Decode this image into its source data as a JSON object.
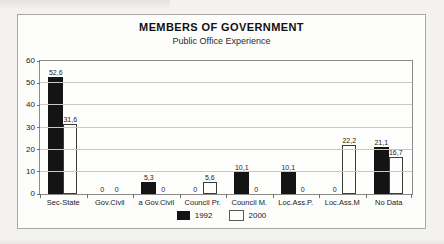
{
  "header": {
    "title": "MEMBERS OF GOVERNMENT",
    "subtitle": "Public Office Experience"
  },
  "chart_data": {
    "type": "bar",
    "title": "MEMBERS OF GOVERNMENT",
    "subtitle": "Public Office Experience",
    "categories": [
      "Sec-State",
      "Gov.Civil",
      "a Gov.Civil",
      "Council Pr.",
      "Council M.",
      "Loc.Ass.P.",
      "Loc.Ass.M",
      "No Data"
    ],
    "series": [
      {
        "name": "1992",
        "color": "#141414",
        "values": [
          52.6,
          0,
          5.3,
          0,
          10.1,
          10.1,
          0,
          21.1
        ]
      },
      {
        "name": "2000",
        "color": "#ffffff",
        "values": [
          31.6,
          0,
          0,
          5.6,
          0,
          0,
          22.2,
          16.7
        ]
      }
    ],
    "value_labels": [
      [
        "52,6",
        "0",
        "5,3",
        "0",
        "10,1",
        "10,1",
        "0",
        "21,1"
      ],
      [
        "31,6",
        "0",
        "0",
        "5,6",
        "0",
        "0",
        "22,2",
        "16,7"
      ]
    ],
    "decimal_separator": ",",
    "ylim": [
      0,
      60
    ],
    "yticks": [
      0,
      10,
      20,
      30,
      40,
      50,
      60
    ],
    "grid": true,
    "legend_position": "bottom-center",
    "legend": [
      "1992",
      "2000"
    ]
  }
}
